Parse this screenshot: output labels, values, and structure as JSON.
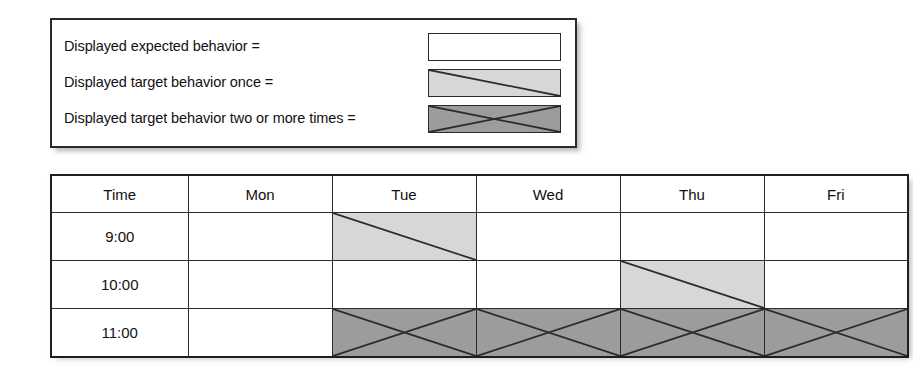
{
  "legend": {
    "title": "",
    "items": [
      {
        "label": "Displayed expected behavior =",
        "swatch": "empty-white-swatch",
        "fill": "#ffffff",
        "pattern": "none"
      },
      {
        "label": "Displayed target behavior once =",
        "swatch": "light-gray-diagonal-swatch",
        "fill": "#d7d7d7",
        "pattern": "diagonal"
      },
      {
        "label": "Displayed target behavior two or more times =",
        "swatch": "dark-gray-cross-swatch",
        "fill": "#9c9c9c",
        "pattern": "cross"
      }
    ]
  },
  "colors": {
    "line": "#2b2b2b",
    "outer_border": "#1f1f1f",
    "fill_none": "#ffffff",
    "fill_once": "#d7d7d7",
    "fill_twice_or_more": "#9c9c9c",
    "page_background": "#ffffff"
  },
  "schedule": {
    "columns": [
      "Time",
      "Mon",
      "Tue",
      "Wed",
      "Thu",
      "Fri"
    ],
    "rows": [
      {
        "time": "9:00",
        "cells": [
          {
            "day": "Mon",
            "pattern": "none"
          },
          {
            "day": "Tue",
            "pattern": "diagonal"
          },
          {
            "day": "Wed",
            "pattern": "none"
          },
          {
            "day": "Thu",
            "pattern": "none"
          },
          {
            "day": "Fri",
            "pattern": "none"
          }
        ]
      },
      {
        "time": "10:00",
        "cells": [
          {
            "day": "Mon",
            "pattern": "none"
          },
          {
            "day": "Tue",
            "pattern": "none"
          },
          {
            "day": "Wed",
            "pattern": "none"
          },
          {
            "day": "Thu",
            "pattern": "diagonal"
          },
          {
            "day": "Fri",
            "pattern": "none"
          }
        ]
      },
      {
        "time": "11:00",
        "cells": [
          {
            "day": "Mon",
            "pattern": "none"
          },
          {
            "day": "Tue",
            "pattern": "cross"
          },
          {
            "day": "Wed",
            "pattern": "cross"
          },
          {
            "day": "Thu",
            "pattern": "cross"
          },
          {
            "day": "Fri",
            "pattern": "cross"
          }
        ]
      }
    ]
  }
}
